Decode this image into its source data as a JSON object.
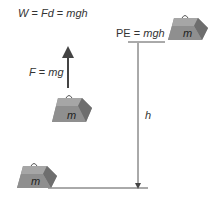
{
  "equation_work": {
    "W": "W",
    "eq1": " = ",
    "Fd": "Fd",
    "eq2": " = ",
    "mgh": "mgh"
  },
  "potential_energy": {
    "PE": "PE",
    "eq": " = ",
    "mgh": "mgh"
  },
  "force": {
    "F": "F",
    "eq": " = ",
    "mg": "mg"
  },
  "height_label": "h",
  "weights": [
    {
      "label": "m",
      "position": "top-right"
    },
    {
      "label": "m",
      "position": "middle"
    },
    {
      "label": "m",
      "position": "bottom-left"
    }
  ],
  "colors": {
    "weight_front": "#8f8f8f",
    "weight_top": "#a6a6a6",
    "weight_side": "#6e6e6e",
    "line": "#444444",
    "text": "#333333"
  }
}
